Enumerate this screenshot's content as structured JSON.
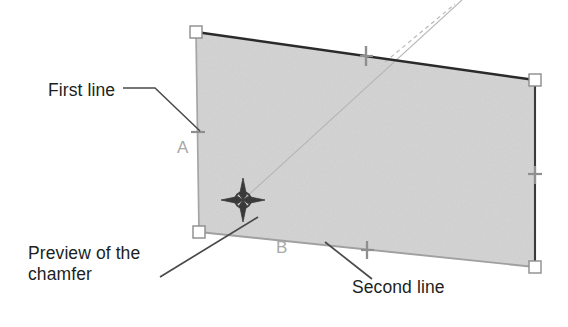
{
  "figure": {
    "kind": "cad-chamfer-preview",
    "background_color": "#ffffff",
    "shape_fill_color": "#cfcfcf",
    "edge_dark_color": "#2a2a2a",
    "edge_light_color": "#9a9a9a",
    "grip_fill_color": "#ffffff",
    "grip_stroke_color": "#8c8c8c",
    "marker_color": "#8f8f8f",
    "cursor_color": "#3a3a3a",
    "label_color": "#a8a8a8",
    "callout_color": "#201f1f",
    "leader_color": "#4a4a4a"
  },
  "callouts": [
    {
      "id": "first-line",
      "text": "First line"
    },
    {
      "id": "preview",
      "text": "Preview of the\nchamfer"
    },
    {
      "id": "second-line",
      "text": "Second line"
    }
  ],
  "callout_text": {
    "first_line": "First line",
    "preview_line1": "Preview of the",
    "preview_line2": "chamfer",
    "second_line": "Second line"
  },
  "vertex_labels": {
    "a": "A",
    "b": "B"
  },
  "shape": {
    "name": "selected-quadrilateral",
    "points": [
      {
        "name": "top-left",
        "x": 196,
        "y": 32
      },
      {
        "name": "top-right",
        "x": 535,
        "y": 80
      },
      {
        "name": "bottom-right",
        "x": 535,
        "y": 267
      },
      {
        "name": "bottom-left",
        "x": 199,
        "y": 232
      }
    ]
  },
  "grips": [
    {
      "name": "grip-top-left",
      "x": 196,
      "y": 32
    },
    {
      "name": "grip-top-right",
      "x": 535,
      "y": 80
    },
    {
      "name": "grip-bottom-right",
      "x": 535,
      "y": 267
    },
    {
      "name": "grip-bottom-left",
      "x": 199,
      "y": 232
    }
  ],
  "midpoint_markers": [
    {
      "name": "midpoint-marker-top",
      "x": 366,
      "y": 56
    },
    {
      "name": "midpoint-marker-right",
      "x": 535,
      "y": 174
    },
    {
      "name": "midpoint-marker-bottom",
      "x": 367,
      "y": 250
    },
    {
      "name": "midpoint-marker-left",
      "x": 198,
      "y": 132
    }
  ],
  "cursor": {
    "name": "crosshair-snap-cursor",
    "x": 243,
    "y": 200,
    "arm_length": 22,
    "circle_radius": 8
  },
  "chamfer_preview_line": {
    "name": "chamfer-preview-line",
    "x1": 243,
    "y1": 200,
    "x2": 462,
    "y2": 0
  },
  "extension_line": {
    "name": "extension-dashed-line",
    "x1": 385,
    "y1": 62,
    "x2": 455,
    "y2": 4
  },
  "leaders": {
    "first_line": [
      {
        "x": 123,
        "y": 88
      },
      {
        "x": 155,
        "y": 88
      },
      {
        "x": 200,
        "y": 131
      }
    ],
    "preview": [
      {
        "x": 160,
        "y": 277
      },
      {
        "x": 258,
        "y": 217
      }
    ],
    "second_line": [
      {
        "x": 325,
        "y": 242
      },
      {
        "x": 372,
        "y": 279
      }
    ]
  }
}
